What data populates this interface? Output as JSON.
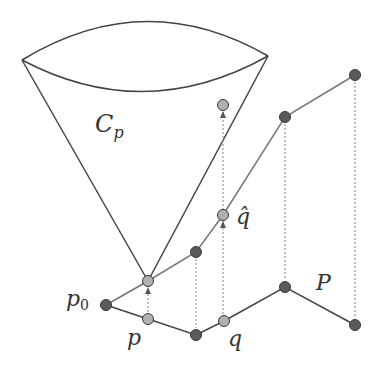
{
  "labels": {
    "cone": "C",
    "cone_sub": "p",
    "q_hat": "q̂",
    "p0": "p",
    "p0_sub": "0",
    "p": "p",
    "q": "q",
    "P": "P"
  },
  "colors": {
    "line_dark": "#444444",
    "line_gray": "#777777",
    "dot_dark": "#5a5a5a",
    "dot_light": "#b0b0b0",
    "dotted": "#999999",
    "arrow": "#555555"
  }
}
